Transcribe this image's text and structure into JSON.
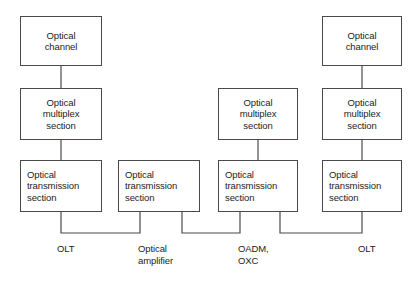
{
  "diagram": {
    "stroke_color": "#4a4a4a",
    "text_color": "#1c1c1c",
    "background_color": "#ffffff",
    "nodes": [
      {
        "id": "ch1",
        "lines": [
          "Optical",
          "channel"
        ],
        "align": "center",
        "x": 20,
        "y": 16,
        "w": 82,
        "h": 50
      },
      {
        "id": "oms1",
        "lines": [
          "Optical",
          "multiplex",
          "section"
        ],
        "align": "center",
        "x": 20,
        "y": 88,
        "w": 82,
        "h": 52
      },
      {
        "id": "ots1",
        "lines": [
          "Optical",
          "transmission",
          "section"
        ],
        "align": "left",
        "x": 20,
        "y": 160,
        "w": 82,
        "h": 52
      },
      {
        "id": "ots2",
        "lines": [
          "Optical",
          "transmission",
          "section"
        ],
        "align": "left",
        "x": 118,
        "y": 160,
        "w": 82,
        "h": 52
      },
      {
        "id": "oms3",
        "lines": [
          "Optical",
          "multiplex",
          "section"
        ],
        "align": "center",
        "x": 218,
        "y": 88,
        "w": 80,
        "h": 52
      },
      {
        "id": "ots3",
        "lines": [
          "Optical",
          "transmission",
          "section"
        ],
        "align": "left",
        "x": 218,
        "y": 160,
        "w": 80,
        "h": 52
      },
      {
        "id": "ch4",
        "lines": [
          "Optical",
          "channel"
        ],
        "align": "center",
        "x": 322,
        "y": 16,
        "w": 80,
        "h": 50
      },
      {
        "id": "oms4",
        "lines": [
          "Optical",
          "multiplex",
          "section"
        ],
        "align": "center",
        "x": 322,
        "y": 88,
        "w": 80,
        "h": 52
      },
      {
        "id": "ots4",
        "lines": [
          "Optical",
          "transmission",
          "section"
        ],
        "align": "left",
        "x": 322,
        "y": 160,
        "w": 80,
        "h": 52
      }
    ],
    "bottom_labels": [
      {
        "id": "olt-left",
        "lines": [
          "OLT"
        ],
        "x": 57,
        "y": 243
      },
      {
        "id": "optical-amplifier",
        "lines": [
          "Optical",
          "amplifier"
        ],
        "x": 138,
        "y": 243
      },
      {
        "id": "oadm-oxc",
        "lines": [
          "OADM,",
          "OXC"
        ],
        "x": 238,
        "y": 243
      },
      {
        "id": "olt-right",
        "lines": [
          "OLT"
        ],
        "x": 358,
        "y": 243
      }
    ],
    "connectors": {
      "vertical": [
        {
          "id": "ch1-oms1",
          "x": 61,
          "y1": 66,
          "y2": 88
        },
        {
          "id": "oms1-ots1",
          "x": 61,
          "y1": 140,
          "y2": 160
        },
        {
          "id": "oms3-ots3",
          "x": 258,
          "y1": 140,
          "y2": 160
        },
        {
          "id": "ch4-oms4",
          "x": 362,
          "y1": 66,
          "y2": 88
        },
        {
          "id": "oms4-ots4",
          "x": 362,
          "y1": 140,
          "y2": 160
        }
      ],
      "u_links": [
        {
          "id": "ots1-ots2",
          "x1": 61,
          "x2": 140,
          "y_top": 212,
          "y_bottom": 233
        },
        {
          "id": "ots2-ots3",
          "x1": 182,
          "x2": 240,
          "y_top": 212,
          "y_bottom": 233
        },
        {
          "id": "ots3-ots4",
          "x1": 280,
          "x2": 362,
          "y_top": 212,
          "y_bottom": 233
        }
      ]
    }
  }
}
